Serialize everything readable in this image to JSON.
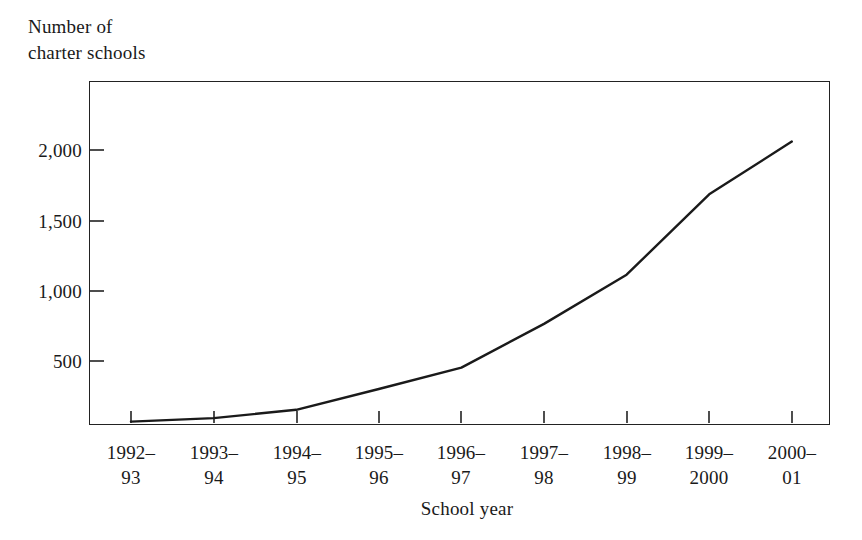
{
  "chart_data": {
    "type": "line",
    "title": "",
    "ylabel": "Number of\ncharter schools",
    "ylabel_line1": "Number of",
    "ylabel_line2": "charter schools",
    "xlabel": "School year",
    "categories": [
      "1992–\n93",
      "1993–\n94",
      "1994–\n95",
      "1995–\n96",
      "1996–\n97",
      "1997–\n98",
      "1998–\n99",
      "1999–\n2000",
      "2000–\n01"
    ],
    "x_tick_labels": [
      {
        "line1": "1992–",
        "line2": "93"
      },
      {
        "line1": "1993–",
        "line2": "94"
      },
      {
        "line1": "1994–",
        "line2": "95"
      },
      {
        "line1": "1995–",
        "line2": "96"
      },
      {
        "line1": "1996–",
        "line2": "97"
      },
      {
        "line1": "1997–",
        "line2": "98"
      },
      {
        "line1": "1998–",
        "line2": "99"
      },
      {
        "line1": "1999–",
        "line2": "2000"
      },
      {
        "line1": "2000–",
        "line2": "01"
      }
    ],
    "values": [
      10,
      35,
      95,
      245,
      400,
      715,
      1070,
      1650,
      2030
    ],
    "y_tick_labels": [
      "2,000",
      "1,500",
      "1,000",
      "500"
    ],
    "y_ticks": [
      2000,
      1500,
      1000,
      500
    ],
    "ylim": [
      0,
      2460
    ],
    "grid": false,
    "legend": false,
    "legend_position": "none",
    "line_color": "#1a1a1a",
    "axis_color": "#222222",
    "background_color": "#ffffff"
  }
}
